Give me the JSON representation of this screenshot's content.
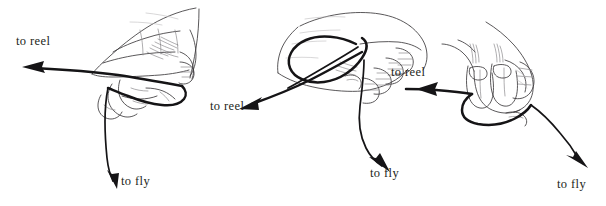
{
  "figure": {
    "background_color": "#ffffff",
    "ink_color": "#231f20",
    "line_color": "#3c3a3c",
    "cord_color": "#151416",
    "width": 606,
    "height": 206,
    "panel_count": 3
  },
  "panels": [
    {
      "id": "panel-1",
      "name": "left-hand-grip-step-1",
      "labels": [
        {
          "id": "label-to-reel-1",
          "text": "to reel",
          "x": 16,
          "y": 35
        },
        {
          "id": "label-to-fly-1",
          "text": "to fly",
          "x": 121,
          "y": 175
        }
      ],
      "arrows": [
        {
          "id": "arrow-to-reel-1",
          "direction": "left",
          "points_to": "to reel"
        },
        {
          "id": "arrow-to-fly-1",
          "direction": "down-right",
          "points_to": "to fly"
        }
      ]
    },
    {
      "id": "panel-2",
      "name": "hand-grip-step-2",
      "labels": [
        {
          "id": "label-to-reel-2",
          "text": "to reel",
          "x": 210,
          "y": 100
        },
        {
          "id": "label-to-fly-2",
          "text": "to fly",
          "x": 370,
          "y": 167
        }
      ],
      "arrows": [
        {
          "id": "arrow-to-reel-2",
          "direction": "down-left",
          "points_to": "to reel"
        },
        {
          "id": "arrow-to-fly-2",
          "direction": "down-right",
          "points_to": "to fly"
        }
      ]
    },
    {
      "id": "panel-3",
      "name": "hand-grip-step-3",
      "labels": [
        {
          "id": "label-to-reel-3",
          "text": "to reel",
          "x": 391,
          "y": 66
        },
        {
          "id": "label-to-fly-3",
          "text": "to fly",
          "x": 557,
          "y": 178
        }
      ],
      "arrows": [
        {
          "id": "arrow-to-reel-3",
          "direction": "left",
          "points_to": "to reel"
        },
        {
          "id": "arrow-to-fly-3",
          "direction": "down-right",
          "points_to": "to fly"
        }
      ]
    }
  ]
}
